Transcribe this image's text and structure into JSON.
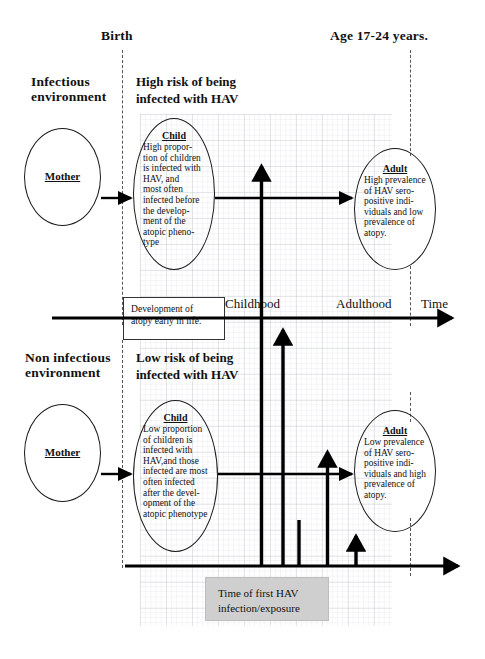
{
  "diagram": {
    "title_hint": "HAV infection timing and atopy development schematic",
    "headers": {
      "birth": "Birth",
      "age": "Age 17-24 years."
    },
    "top_half": {
      "environment_label": "Infectious\nenvironment",
      "risk_label": "High risk of being\ninfected with HAV",
      "mother_label": "Mother",
      "child": {
        "title": "Child",
        "body": "High propor-\ntion of children\nis infected with\nHAV, and\nmost often\ninfected before\nthe develop-\nment of the\natopic pheno-\ntype"
      },
      "adult": {
        "title": "Adult",
        "body": "High prevalence\nof HAV sero-\npositive indi-\nviduals and low\nprevalence of\natopy."
      }
    },
    "bottom_half": {
      "environment_label": "Non infectious\nenvironment",
      "risk_label": "Low risk of being\ninfected with HAV",
      "mother_label": "Mother",
      "child": {
        "title": "Child",
        "body": "Low proportion\nof children is\ninfected with\nHAV,and those\ninfected are most\noften infected\nafter the devel-\nopment of the\natopic phenotype"
      },
      "adult": {
        "title": "Adult",
        "body": "Low prevalence\nof HAV sero-\npositive indi-\nviduals and high\nprevalence of\natopy."
      }
    },
    "timeline": {
      "childhood": "Childhood",
      "adulthood": "Adulthood",
      "time": "Time"
    },
    "callouts": {
      "atopy_box": "Development of\natopy early in life.",
      "hav_box": "Time of first HAV\ninfection/exposure"
    },
    "colors": {
      "ink": "#111111",
      "grid": "#8a93a6",
      "gray_box": "#cfcfcf",
      "dash": "#555555"
    }
  }
}
